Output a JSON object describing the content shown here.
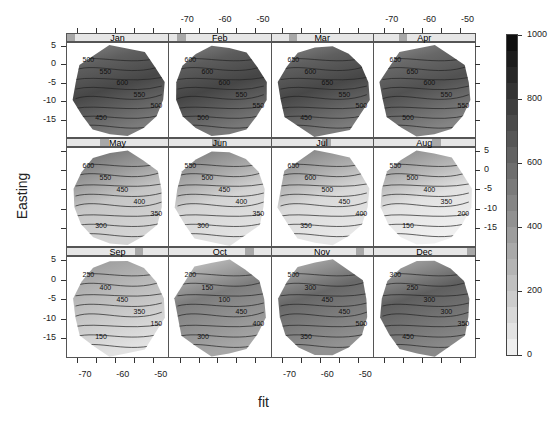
{
  "chart_data": {
    "type": "heatmap",
    "subtype": "filled-contour lattice (levelplot) by month",
    "xlabel": "fit",
    "ylabel": "Easting",
    "x_ticks": [
      -70,
      -60,
      -50
    ],
    "y_ticks": [
      5,
      0,
      -5,
      -10,
      -15
    ],
    "xlim": [
      -75,
      -48
    ],
    "ylim": [
      -20,
      6
    ],
    "colorbar": {
      "ticks": [
        0,
        200,
        400,
        600,
        800,
        1000
      ],
      "range": [
        0,
        1000
      ],
      "palette": "grayscale, white (0) to black (1000)",
      "position": "right"
    },
    "panels": [
      {
        "month": "Jan",
        "contour_labels": [
          500,
          550,
          600,
          550,
          500,
          450,
          450,
          500
        ],
        "approx_mean": 580
      },
      {
        "month": "Feb",
        "contour_labels": [
          600,
          600,
          600,
          550,
          550,
          500,
          450,
          500
        ],
        "approx_mean": 590
      },
      {
        "month": "Mar",
        "contour_labels": [
          650,
          600,
          650,
          550,
          500,
          450,
          450
        ],
        "approx_mean": 580
      },
      {
        "month": "Apr",
        "contour_labels": [
          650,
          650,
          600,
          550,
          550,
          500,
          350,
          350,
          450,
          300
        ],
        "approx_mean": 540
      },
      {
        "month": "May",
        "contour_labels": [
          600,
          550,
          450,
          400,
          350,
          300,
          250,
          200,
          200,
          200,
          250,
          200,
          150
        ],
        "approx_mean": 340
      },
      {
        "month": "Jun",
        "contour_labels": [
          550,
          500,
          450,
          400,
          350,
          300,
          250,
          200,
          150,
          50,
          100,
          100
        ],
        "approx_mean": 280
      },
      {
        "month": "Jul",
        "contour_labels": [
          650,
          600,
          500,
          450,
          400,
          350,
          300,
          250,
          150,
          100,
          50,
          100,
          100
        ],
        "approx_mean": 260
      },
      {
        "month": "Aug",
        "contour_labels": [
          550,
          500,
          400,
          350,
          200,
          150,
          100,
          50,
          100,
          100,
          100
        ],
        "approx_mean": 220
      },
      {
        "month": "Sep",
        "contour_labels": [
          250,
          400,
          450,
          350,
          150,
          150,
          150,
          250,
          250,
          350,
          150,
          150
        ],
        "approx_mean": 260
      },
      {
        "month": "Oct",
        "contour_labels": [
          200,
          150,
          100,
          450,
          400,
          300,
          350,
          400,
          300,
          250,
          200,
          350,
          250,
          250
        ],
        "approx_mean": 330
      },
      {
        "month": "Nov",
        "contour_labels": [
          500,
          300,
          450,
          450,
          500,
          350,
          300,
          450,
          500,
          350,
          500,
          300,
          250,
          350,
          300
        ],
        "approx_mean": 420
      },
      {
        "month": "Dec",
        "contour_labels": [
          300,
          250,
          300,
          300,
          350,
          450,
          500,
          550,
          500,
          550,
          550,
          450,
          350,
          350
        ],
        "approx_mean": 460
      }
    ],
    "layout": {
      "columns": 4,
      "rows": 3,
      "grid": false
    }
  },
  "axes": {
    "ylabel": "Easting",
    "xlabel": "fit",
    "top_ticks": [
      "-70",
      "-60",
      "-50"
    ],
    "bottom_ticks": [
      "-70",
      "-60",
      "-50"
    ],
    "left_ticks": [
      "5",
      "0",
      "-5",
      "-10",
      "-15"
    ],
    "right_ticks": [
      "5",
      "0",
      "-5",
      "-10",
      "-15"
    ]
  },
  "colorbar": {
    "labels": [
      "1000",
      "800",
      "600",
      "400",
      "200",
      "0"
    ]
  },
  "strips": [
    {
      "label": "Jan",
      "shingle_pos": 0.0
    },
    {
      "label": "Feb",
      "shingle_pos": 0.08
    },
    {
      "label": "Mar",
      "shingle_pos": 0.17
    },
    {
      "label": "Apr",
      "shingle_pos": 0.25
    },
    {
      "label": "May",
      "shingle_pos": 0.33
    },
    {
      "label": "Jun",
      "shingle_pos": 0.42
    },
    {
      "label": "Jul",
      "shingle_pos": 0.5
    },
    {
      "label": "Aug",
      "shingle_pos": 0.58
    },
    {
      "label": "Sep",
      "shingle_pos": 0.67
    },
    {
      "label": "Oct",
      "shingle_pos": 0.75
    },
    {
      "label": "Nov",
      "shingle_pos": 0.83
    },
    {
      "label": "Dec",
      "shingle_pos": 0.92
    }
  ]
}
